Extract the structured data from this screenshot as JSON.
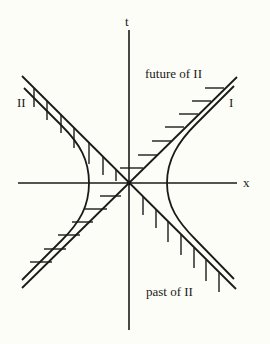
{
  "diagram": {
    "axes": {
      "t_label": "t",
      "x_label": "x"
    },
    "observers": {
      "left_label": "II",
      "right_label": "I"
    },
    "regions": {
      "future_label": "future of II",
      "past_label": "past of II"
    },
    "colors": {
      "background": "#fdfdf7",
      "ink": "#1a1a1a"
    }
  }
}
